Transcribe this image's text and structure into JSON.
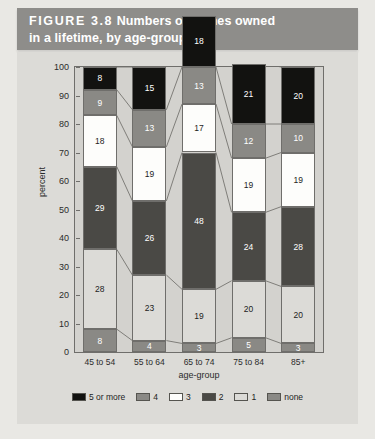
{
  "banner": {
    "figure_label": "FIGURE 3.8",
    "title_line1": "Numbers of homes owned",
    "title_line2": "in a lifetime, by age-group"
  },
  "chart_data": {
    "type": "bar",
    "stacked": true,
    "title": "Numbers of homes owned in a lifetime, by age-group",
    "xlabel": "age-group",
    "ylabel": "percent",
    "ylim": [
      0,
      100
    ],
    "yticks": [
      0,
      10,
      20,
      30,
      40,
      50,
      60,
      70,
      80,
      90,
      100
    ],
    "grid": false,
    "legend_position": "bottom",
    "categories": [
      "45 to 54",
      "55 to 64",
      "65 to 74",
      "75 to 84",
      "85+"
    ],
    "series": [
      {
        "name": "none",
        "color": "#8a8985",
        "text_color": "#ffffff",
        "values": [
          8,
          4,
          3,
          5,
          3
        ]
      },
      {
        "name": "1",
        "color": "#dcdbd7",
        "text_color": "#1d1d1d",
        "values": [
          28,
          23,
          19,
          20,
          20
        ]
      },
      {
        "name": "2",
        "color": "#4a4945",
        "text_color": "#ffffff",
        "values": [
          29,
          26,
          48,
          24,
          28
        ]
      },
      {
        "name": "3",
        "color": "#fdfdfb",
        "text_color": "#1d1d1d",
        "values": [
          18,
          19,
          17,
          19,
          19
        ]
      },
      {
        "name": "4",
        "color": "#8a8985",
        "text_color": "#ffffff",
        "values": [
          9,
          13,
          13,
          12,
          10
        ]
      },
      {
        "name": "5 or more",
        "color": "#121210",
        "text_color": "#ffffff",
        "values": [
          8,
          15,
          18,
          21,
          20
        ]
      }
    ],
    "legend_order": [
      "5 or more",
      "4",
      "3",
      "2",
      "1",
      "none"
    ]
  }
}
